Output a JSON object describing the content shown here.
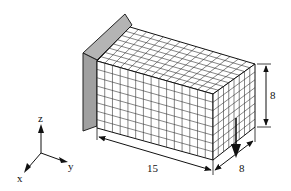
{
  "figure": {
    "type": "3D mesh block with fixed support plate",
    "mesh": {
      "length_divisions": 15,
      "width_divisions": 8,
      "height_divisions": 8
    },
    "dimensions": {
      "length_label": "15",
      "width_label": "8",
      "height_label": "8"
    },
    "axes": {
      "x_label": "x",
      "y_label": "y",
      "z_label": "z"
    },
    "colors": {
      "plate": "#a8a8a8",
      "mesh_line": "#333333",
      "face": "#ffffff",
      "ink": "#111111"
    }
  }
}
